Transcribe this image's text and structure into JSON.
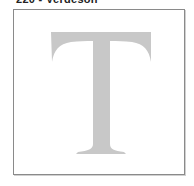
{
  "caption": "220 - Verdeson",
  "preview": {
    "character": "T",
    "glyph_color": "#c8c8c8",
    "border_color": "#8a8a8a",
    "background": "#ffffff"
  }
}
